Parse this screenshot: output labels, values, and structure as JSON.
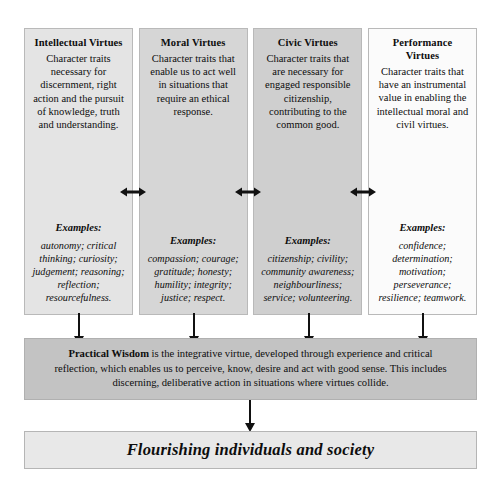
{
  "diagram": {
    "columns": [
      {
        "title": "Intellectual Virtues",
        "description": "Character traits necessary for discernment, right action and the pursuit of knowledge, truth and understanding.",
        "examples_label": "Examples:",
        "examples": "autonomy; critical thinking; curiosity; judgement; reasoning; reflection; resourcefulness.",
        "tint": "#e4e4e4"
      },
      {
        "title": "Moral Virtues",
        "description": "Character traits that enable us to act well in situations that require an ethical response.",
        "examples_label": "Examples:",
        "examples": "compassion; courage; gratitude; honesty; humility; integrity; justice; respect.",
        "tint": "#d6d6d6"
      },
      {
        "title": "Civic Virtues",
        "description": "Character traits that are necessary for engaged responsible citizenship, contributing to the common good.",
        "examples_label": "Examples:",
        "examples": "citizenship; civility; community awareness; neighbourliness; service; volunteering.",
        "tint": "#cfcfcf"
      },
      {
        "title": "Performance Virtues",
        "description": "Character traits that have an instrumental value in enabling the intellectual moral and civil virtues.",
        "examples_label": "Examples:",
        "examples": "confidence; determination; motivation; perseverance; resilience; teamwork.",
        "tint": "#fbfbfb"
      }
    ],
    "practical_wisdom": {
      "lead": "Practical Wisdom",
      "body": " is the integrative virtue, developed through experience and critical reflection, which enables us to perceive, know, desire and act with good sense. This includes discerning, deliberative action in situations where virtues collide.",
      "tint": "#c3c3c3"
    },
    "outcome": {
      "label": "Flourishing individuals and society",
      "tint": "#e8e8e8"
    },
    "connectors": {
      "horizontal_arrow_icon": "double-headed-arrow-icon",
      "vertical_arrow_icon": "down-arrow-icon"
    }
  }
}
